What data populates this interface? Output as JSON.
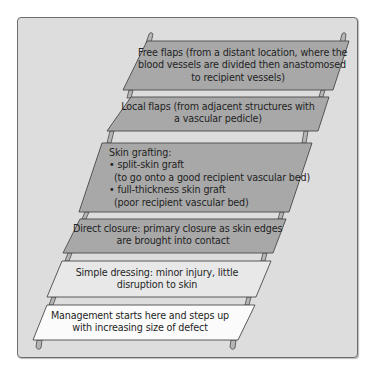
{
  "diagram": {
    "type": "ladder",
    "direction": "bottom-to-top",
    "colors": {
      "frame_bg": "#dddddd",
      "frame_border": "#6d6d6d",
      "step_dark": "#a8a8a8",
      "step_light": "#e8e8e8",
      "step_white": "#fbfbfb",
      "outline": "#4a4a4a"
    },
    "steps": [
      {
        "id": "free-flaps",
        "lines": [
          "Free flaps (from a distant location, where the",
          "blood vessels are divided then anastomosed",
          "to recipient vessels)"
        ]
      },
      {
        "id": "local-flaps",
        "lines": [
          "Local flaps (from adjacent structures with",
          "a vascular pedicle)"
        ]
      },
      {
        "id": "skin-grafting",
        "lines": [
          "Skin grafting:",
          "• split-skin graft",
          "  (to go onto a good recipient vascular bed)",
          "• full-thickness skin graft",
          "  (poor recipient vascular bed)"
        ]
      },
      {
        "id": "direct-closure",
        "lines": [
          "Direct closure: primary closure as skin edges",
          "are brought into contact"
        ]
      },
      {
        "id": "simple-dressing",
        "lines": [
          "Simple dressing: minor injury, little",
          "disruption to skin"
        ]
      },
      {
        "id": "management-start",
        "lines": [
          "Management starts here and steps up",
          "with increasing size of defect"
        ]
      }
    ]
  }
}
